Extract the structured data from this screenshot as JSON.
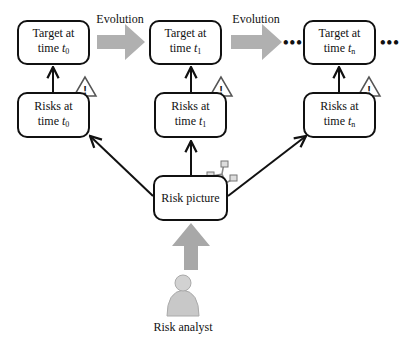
{
  "diagram": {
    "targets": [
      {
        "line1": "Target at",
        "line2_prefix": "time ",
        "var": "t",
        "sub": "0"
      },
      {
        "line1": "Target at",
        "line2_prefix": "time ",
        "var": "t",
        "sub": "1"
      },
      {
        "line1": "Target at",
        "line2_prefix": "time ",
        "var": "t",
        "sub": "n"
      }
    ],
    "risks": [
      {
        "line1": "Risks at",
        "line2_prefix": "time ",
        "var": "t",
        "sub": "0"
      },
      {
        "line1": "Risks at",
        "line2_prefix": "time ",
        "var": "t",
        "sub": "1"
      },
      {
        "line1": "Risks at",
        "line2_prefix": "time ",
        "var": "t",
        "sub": "n"
      }
    ],
    "evolution_labels": [
      "Evolution",
      "Evolution"
    ],
    "ellipsis": "•••",
    "risk_picture": "Risk picture",
    "risk_analyst": "Risk analyst",
    "warning_glyph": "!",
    "icons": [
      "warning-icon",
      "network-icon",
      "person-icon"
    ],
    "colors": {
      "stroke": "#111111",
      "evolution_arrow": "#b0b0b0",
      "person": "#c8c8c8"
    }
  }
}
